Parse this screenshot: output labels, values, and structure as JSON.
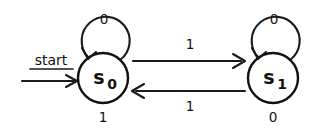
{
  "diagram": {
    "type": "finite-state-machine",
    "start": {
      "label": "start",
      "target_state": "s0"
    },
    "states": [
      {
        "id": "s0",
        "name": "s",
        "subscript": "0",
        "output": "1",
        "cx": 103,
        "cy": 78,
        "r": 25
      },
      {
        "id": "s1",
        "name": "s",
        "subscript": "1",
        "output": "0",
        "cx": 273,
        "cy": 78,
        "r": 25
      }
    ],
    "transitions": [
      {
        "id": "s0-self",
        "from": "s0",
        "to": "s0",
        "input": "0",
        "kind": "self-loop"
      },
      {
        "id": "s0-to-s1",
        "from": "s0",
        "to": "s1",
        "input": "1",
        "kind": "forward"
      },
      {
        "id": "s1-to-s0",
        "from": "s1",
        "to": "s0",
        "input": "1",
        "kind": "backward"
      },
      {
        "id": "s1-self",
        "from": "s1",
        "to": "s1",
        "input": "0",
        "kind": "self-loop"
      }
    ],
    "colors": {
      "stroke": "#111111",
      "background": "#ffffff"
    }
  }
}
